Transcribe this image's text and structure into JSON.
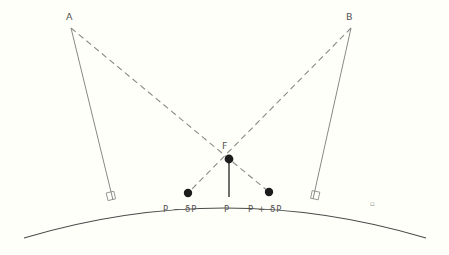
{
  "figure": {
    "background_color": "#fffffa",
    "line_color": "#6b6b6b",
    "arc_color": "#4a4a4a",
    "dash_color": "#7d7d7d",
    "dot_color": "#1c1c1c",
    "label_color": "#4a4a4a"
  },
  "labels": {
    "station_a": "A",
    "station_b": "B",
    "focus": "F",
    "point_minus": "P − δP",
    "point_center": "P",
    "point_plus": "P + δP",
    "corner_mark": "▫"
  },
  "geometry": {
    "arc": {
      "start_x": 24,
      "start_y": 238,
      "end_x": 426,
      "end_y": 238,
      "apex_x": 225,
      "apex_y": 196
    },
    "station_a_point": {
      "x": 71,
      "y": 28
    },
    "station_b_point": {
      "x": 351,
      "y": 28
    },
    "focus_point": {
      "x": 229,
      "y": 159
    },
    "point_minus_dot": {
      "x": 188,
      "y": 193
    },
    "point_center_dot": {
      "x": 229,
      "y": 196
    },
    "point_plus_dot": {
      "x": 269,
      "y": 192
    },
    "foot_a": {
      "x": 113,
      "y": 200
    },
    "foot_b": {
      "x": 313,
      "y": 199
    },
    "corner_mark_pos": {
      "x": 373,
      "y": 205
    }
  },
  "elements": {
    "solid_line_a": "normal line from station A to surface",
    "solid_line_b": "normal line from station B to surface",
    "dashed_line_a_f": "sight line from A through F",
    "dashed_line_b_f": "sight line from B through F",
    "plumb_line": "vertical line from F to P",
    "right_angle_a": "right angle marker at foot of A",
    "right_angle_b": "right angle marker at foot of B"
  }
}
